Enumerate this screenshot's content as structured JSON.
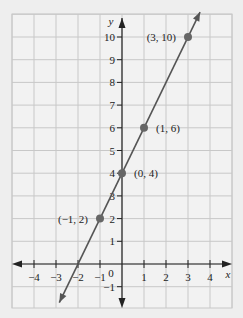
{
  "chart_data": {
    "type": "line",
    "title": "",
    "xlabel": "x",
    "ylabel": "y",
    "xlim": [
      -5,
      5
    ],
    "ylim": [
      -2,
      11
    ],
    "grid": true,
    "x_ticks": [
      -4,
      -3,
      -2,
      -1,
      1,
      2,
      3,
      4
    ],
    "y_ticks": [
      -1,
      1,
      2,
      3,
      4,
      5,
      6,
      7,
      8,
      9,
      10
    ],
    "origin_label": "0",
    "line": {
      "equation": "y = 2x + 4",
      "slope": 2,
      "intercept": 4
    },
    "points": [
      {
        "x": -1,
        "y": 2,
        "label": "(−1, 2)"
      },
      {
        "x": 0,
        "y": 4,
        "label": "(0, 4)"
      },
      {
        "x": 1,
        "y": 6,
        "label": "(1, 6)"
      },
      {
        "x": 3,
        "y": 10,
        "label": "(3, 10)"
      }
    ],
    "colors": {
      "background": "#eeeeee",
      "grid": "#c8c8c8",
      "axes": "#222222",
      "line": "#555555",
      "points": "#666666"
    }
  }
}
